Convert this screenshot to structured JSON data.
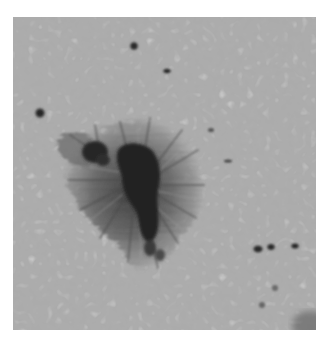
{
  "image": {
    "subject": "Sunspot with surrounding solar granulation",
    "description": "Grayscale photograph of a solar sunspot: dark umbra surrounded by filamentary penumbra, with small pores scattered in granulated photosphere",
    "colors": {
      "background_margin": "#ffffff",
      "granulation_base": "#a9a9a9",
      "granulation_light": "#c4c4c4",
      "granulation_dark": "#8a8a8a",
      "penumbra": "#6a6a6a",
      "umbra": "#232323"
    },
    "features": {
      "main_umbra": {
        "cx": 140,
        "cy": 185,
        "label": "umbra"
      },
      "secondary_umbra": {
        "cx": 95,
        "cy": 155,
        "label": "umbra fragment"
      },
      "penumbra": {
        "cx": 135,
        "cy": 195,
        "label": "penumbra"
      },
      "pores": [
        {
          "cx": 134,
          "cy": 46
        },
        {
          "cx": 167,
          "cy": 71
        },
        {
          "cx": 40,
          "cy": 113
        },
        {
          "cx": 258,
          "cy": 249
        },
        {
          "cx": 272,
          "cy": 247
        },
        {
          "cx": 295,
          "cy": 246
        }
      ]
    }
  }
}
